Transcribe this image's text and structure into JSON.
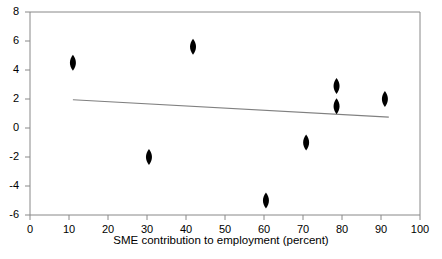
{
  "chart_data": {
    "type": "scatter",
    "title": "",
    "xlabel": "SME contribution to employment (percent)",
    "ylabel": "",
    "xlim": [
      0,
      100
    ],
    "ylim": [
      -6,
      8
    ],
    "xticks": [
      0,
      10,
      20,
      30,
      40,
      50,
      60,
      70,
      80,
      90,
      100
    ],
    "yticks": [
      -6,
      -4,
      -2,
      0,
      2,
      4,
      6,
      8
    ],
    "xtick_labels": [
      "0",
      "10",
      "20",
      "30",
      "40",
      "50",
      "60",
      "70",
      "80",
      "90",
      "100"
    ],
    "ytick_labels": [
      "-6",
      "-4",
      "-2",
      "0",
      "2",
      "4",
      "6",
      "8"
    ],
    "grid": false,
    "legend": "none",
    "marker": "diamond",
    "marker_color": "#000000",
    "points": [
      {
        "x": 11.0,
        "y": 4.5
      },
      {
        "x": 30.5,
        "y": -2.0
      },
      {
        "x": 41.8,
        "y": 5.6
      },
      {
        "x": 60.5,
        "y": -5.0
      },
      {
        "x": 70.8,
        "y": -1.0
      },
      {
        "x": 78.6,
        "y": 2.9
      },
      {
        "x": 78.6,
        "y": 1.5
      },
      {
        "x": 91.0,
        "y": 2.0
      }
    ],
    "trendline": {
      "color": "#808080",
      "x_start": 11.0,
      "y_start": 1.95,
      "x_end": 92.0,
      "y_end": 0.75
    }
  }
}
